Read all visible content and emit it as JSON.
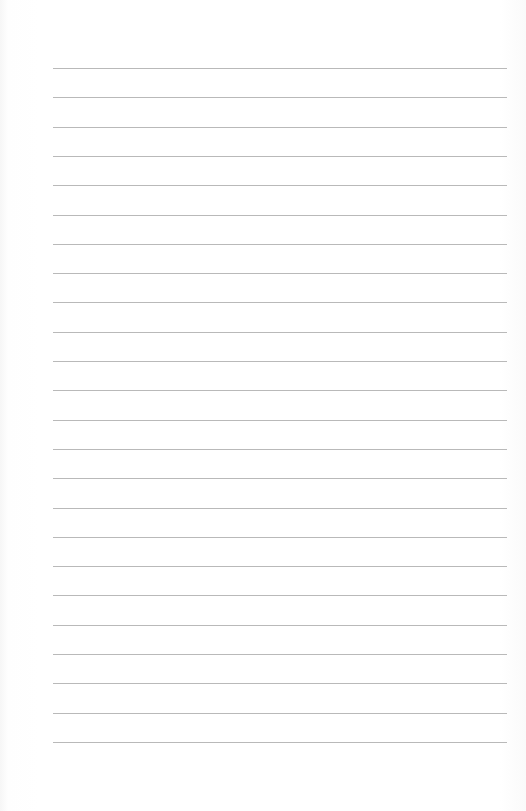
{
  "document": {
    "type": "lined-paper",
    "line_count": 24,
    "line_color": "#b9b9b9",
    "background_color": "#ffffff",
    "first_line_y": 68,
    "line_spacing": 29.3,
    "line_left": 53,
    "line_right": 507
  }
}
